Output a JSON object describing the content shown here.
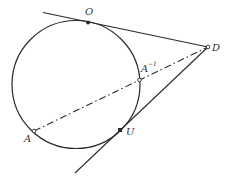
{
  "diagram": {
    "colors": {
      "stroke": "#2a2a2a",
      "label": "#333333",
      "background": "#ffffff"
    },
    "circle": {
      "cx": 76,
      "cy": 84.5,
      "r": 64
    },
    "points": {
      "O": {
        "label": "O",
        "x": 88,
        "y": 22.5,
        "marker": "filled"
      },
      "D": {
        "label": "D",
        "x": 208,
        "y": 47,
        "marker": "open"
      },
      "A_inv": {
        "label": "A",
        "sup": "−1",
        "x": 139.5,
        "y": 80,
        "marker": "open"
      },
      "A": {
        "label": "A",
        "x": 34,
        "y": 131,
        "marker": "open"
      },
      "U": {
        "label": "U",
        "x": 120,
        "y": 130,
        "marker": "filled"
      }
    },
    "lines": [
      {
        "name": "tangent-line-O-D",
        "style": "solid"
      },
      {
        "name": "tangent-line-U-D",
        "style": "solid"
      },
      {
        "name": "secant-line-A-D",
        "style": "dash-dot"
      }
    ]
  }
}
